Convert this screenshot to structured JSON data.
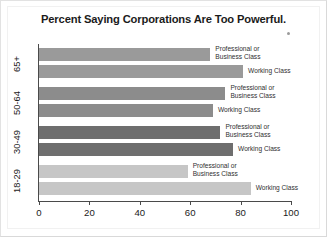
{
  "chart_data": {
    "type": "bar",
    "orientation": "horizontal",
    "title": "Percent Saying Corporations Are Too Powerful.",
    "xlabel": "",
    "ylabel": "",
    "xlim": [
      0,
      100
    ],
    "xticks": [
      0,
      20,
      40,
      60,
      80,
      100
    ],
    "grid": false,
    "legend": "inline-labels",
    "categories": [
      "65+",
      "50-64",
      "30-49",
      "18-29"
    ],
    "series": [
      {
        "name": "Professional or Business Class",
        "values": [
          68,
          74,
          72,
          59
        ]
      },
      {
        "name": "Working Class",
        "values": [
          81,
          69,
          77,
          84
        ]
      }
    ],
    "groups": [
      {
        "category": "65+",
        "color": "#9a9a9a",
        "bars": [
          {
            "series": "Professional or Business Class",
            "label": "Professional or\nBusiness Class",
            "value": 68
          },
          {
            "series": "Working Class",
            "label": "Working Class",
            "value": 81
          }
        ]
      },
      {
        "category": "50-64",
        "color": "#8c8c8c",
        "bars": [
          {
            "series": "Professional or Business Class",
            "label": "Professional or\nBusiness Class",
            "value": 74
          },
          {
            "series": "Working Class",
            "label": "Working Class",
            "value": 69
          }
        ]
      },
      {
        "category": "30-49",
        "color": "#6e6e6e",
        "bars": [
          {
            "series": "Professional or Business Class",
            "label": "Professional or\nBusiness Class",
            "value": 72
          },
          {
            "series": "Working Class",
            "label": "Working Class",
            "value": 77
          }
        ]
      },
      {
        "category": "18-29",
        "color": "#c6c6c6",
        "bars": [
          {
            "series": "Professional or Business Class",
            "label": "Professional or\nBusiness Class",
            "value": 59
          },
          {
            "series": "Working Class",
            "label": "Working Class",
            "value": 84
          }
        ]
      }
    ]
  },
  "figure": {
    "background_color": "#ffffff",
    "axis_color": "#4a4a4a",
    "title_color": "#1b1b1b",
    "footnote_marker": "·"
  }
}
